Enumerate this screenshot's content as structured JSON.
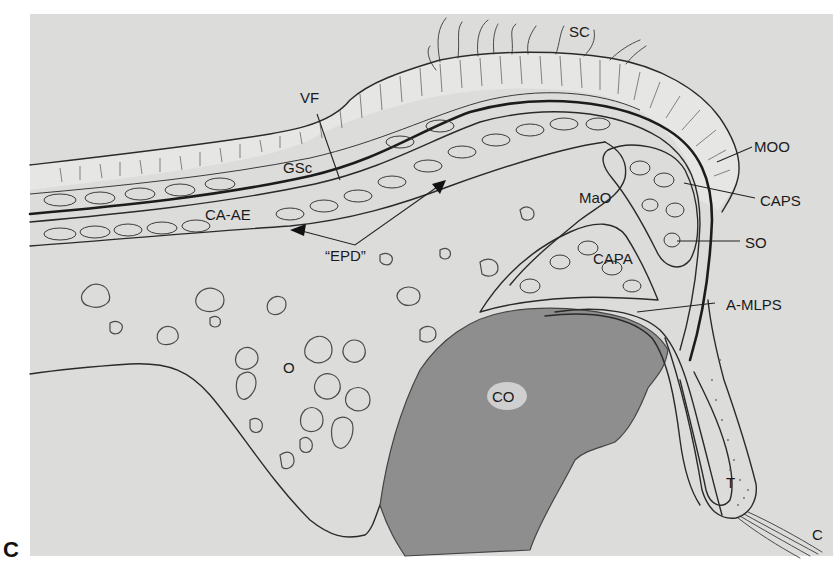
{
  "figure": {
    "panel_letter": "C",
    "type": "anatomical cross-section illustration (upper eyelid / orbit, sagittal)",
    "colors": {
      "page_background": "#ffffff",
      "panel_background": "#dcdcda",
      "conjunctiva_orbit_shade": "#8e8e8e",
      "ink": "#222222"
    },
    "labels": {
      "sc": "SC",
      "vf": "VF",
      "gsc": "GSc",
      "ca_ae": "CA-AE",
      "epd": "“EPD”",
      "mao": "MaO",
      "moo": "MOO",
      "caps": "CAPS",
      "so": "SO",
      "capa": "CAPA",
      "a_mlps": "A-MLPS",
      "o": "O",
      "co": "CO",
      "t": "T",
      "c": "C"
    }
  }
}
